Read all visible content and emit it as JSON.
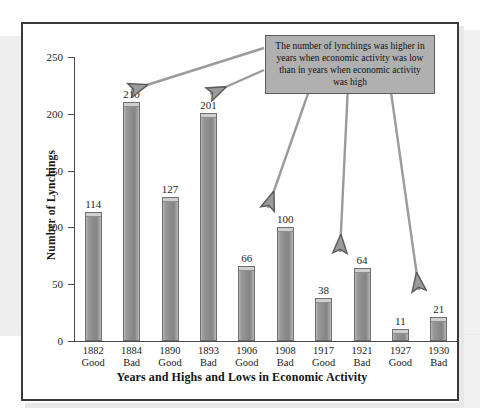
{
  "figure": {
    "annotation": "The number of lynchings was higher in years when economic activity was low than in years when economic activity was high"
  },
  "chart_data": {
    "type": "bar",
    "title": "",
    "xlabel": "Years and Highs and Lows in Economic Activity",
    "ylabel": "Number of Lynchings",
    "ylim": [
      0,
      250
    ],
    "yticks": [
      "0",
      "50",
      "100",
      "150",
      "200",
      "250"
    ],
    "grid": false,
    "legend": "none",
    "categories": [
      "1882\nGood",
      "1884\nBad",
      "1890\nGood",
      "1893\nBad",
      "1906\nGood",
      "1908\nBad",
      "1917\nGood",
      "1921\nBad",
      "1927\nGood",
      "1930\nBad"
    ],
    "bars": [
      {
        "year": "1882",
        "economy": "Good",
        "value": 114,
        "label": "114"
      },
      {
        "year": "1884",
        "economy": "Bad",
        "value": 210,
        "label": "210"
      },
      {
        "year": "1890",
        "economy": "Good",
        "value": 127,
        "label": "127"
      },
      {
        "year": "1893",
        "economy": "Bad",
        "value": 201,
        "label": "201"
      },
      {
        "year": "1906",
        "economy": "Good",
        "value": 66,
        "label": "66"
      },
      {
        "year": "1908",
        "economy": "Bad",
        "value": 100,
        "label": "100"
      },
      {
        "year": "1917",
        "economy": "Good",
        "value": 38,
        "label": "38"
      },
      {
        "year": "1921",
        "economy": "Bad",
        "value": 64,
        "label": "64"
      },
      {
        "year": "1927",
        "economy": "Good",
        "value": 11,
        "label": "11"
      },
      {
        "year": "1930",
        "economy": "Bad",
        "value": 21,
        "label": "21"
      }
    ],
    "values": [
      114,
      210,
      127,
      201,
      66,
      100,
      38,
      64,
      11,
      21
    ],
    "annotation_targets": [
      "1884",
      "1893",
      "1908",
      "1921",
      "1930"
    ],
    "colors": {
      "bar_face": "#8d8d8d",
      "bar_edge": "#6f6f6f",
      "bar_highlight": "#cfcfcf",
      "annotation_fill": "#b0b0b0",
      "annotation_edge": "#5c5c5c",
      "frame": "#3a3a3a",
      "axis": "#4a4a4a",
      "text": "#1a1a1a",
      "background": "#ffffff"
    }
  }
}
